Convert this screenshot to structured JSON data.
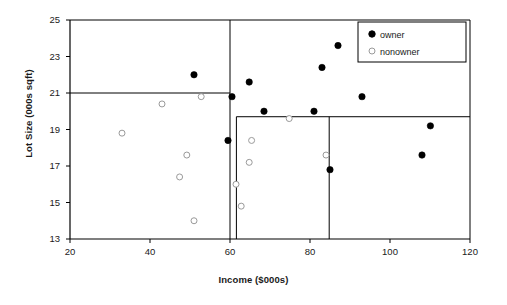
{
  "chart_data": {
    "type": "scatter",
    "title": "",
    "xlabel": "Income ($000s)",
    "ylabel": "Lot Size (000s sqft)",
    "xlim": [
      20,
      120
    ],
    "ylim": [
      13,
      25
    ],
    "xticks": [
      20,
      40,
      60,
      80,
      100,
      120
    ],
    "yticks": [
      13,
      15,
      17,
      19,
      21,
      23,
      25
    ],
    "grid": false,
    "legend_position": "top-right",
    "series": [
      {
        "name": "owner",
        "marker": "filled-circle",
        "color": "#000000",
        "points": [
          {
            "x": 51.0,
            "y": 22.0
          },
          {
            "x": 60.5,
            "y": 20.8
          },
          {
            "x": 64.8,
            "y": 21.6
          },
          {
            "x": 68.5,
            "y": 20.0
          },
          {
            "x": 83.0,
            "y": 22.4
          },
          {
            "x": 87.0,
            "y": 23.6
          },
          {
            "x": 81.0,
            "y": 20.0
          },
          {
            "x": 93.0,
            "y": 20.8
          },
          {
            "x": 59.5,
            "y": 18.4
          },
          {
            "x": 85.0,
            "y": 16.8
          },
          {
            "x": 110.1,
            "y": 19.2
          },
          {
            "x": 108.0,
            "y": 17.6
          }
        ]
      },
      {
        "name": "nonowner",
        "marker": "open-circle",
        "color": "#9a9a9a",
        "points": [
          {
            "x": 33.0,
            "y": 18.8
          },
          {
            "x": 43.0,
            "y": 20.4
          },
          {
            "x": 52.8,
            "y": 20.8
          },
          {
            "x": 47.4,
            "y": 16.4
          },
          {
            "x": 49.2,
            "y": 17.6
          },
          {
            "x": 51.0,
            "y": 14.0
          },
          {
            "x": 61.5,
            "y": 16.0
          },
          {
            "x": 62.8,
            "y": 14.8
          },
          {
            "x": 65.4,
            "y": 18.4
          },
          {
            "x": 64.8,
            "y": 17.2
          },
          {
            "x": 74.8,
            "y": 19.6
          },
          {
            "x": 84.0,
            "y": 17.6
          }
        ]
      }
    ],
    "partition_lines": [
      {
        "orientation": "vertical",
        "x": 60.0,
        "y_from": 13.0,
        "y_to": 25.0
      },
      {
        "orientation": "vertical",
        "x": 61.6,
        "y_from": 13.0,
        "y_to": 19.7
      },
      {
        "orientation": "vertical",
        "x": 84.8,
        "y_from": 13.0,
        "y_to": 19.7
      },
      {
        "orientation": "horizontal",
        "y": 21.0,
        "x_from": 20.0,
        "x_to": 60.0
      },
      {
        "orientation": "horizontal",
        "y": 19.7,
        "x_from": 61.6,
        "x_to": 120.0
      }
    ]
  },
  "legend": {
    "items": [
      {
        "label": "owner",
        "marker": "filled-circle"
      },
      {
        "label": "nonowner",
        "marker": "open-circle"
      }
    ]
  },
  "axes": {
    "x_tick_labels": [
      "20",
      "40",
      "60",
      "80",
      "100",
      "120"
    ],
    "y_tick_labels": [
      "13",
      "15",
      "17",
      "19",
      "21",
      "23",
      "25"
    ],
    "x_axis_title": "Income ($000s)",
    "y_axis_title": "Lot Size (000s sqft)"
  },
  "colors": {
    "axis": "#000000",
    "owner_marker": "#000000",
    "nonowner_marker": "#9a9a9a",
    "partition_line": "#000000",
    "background": "#ffffff"
  }
}
